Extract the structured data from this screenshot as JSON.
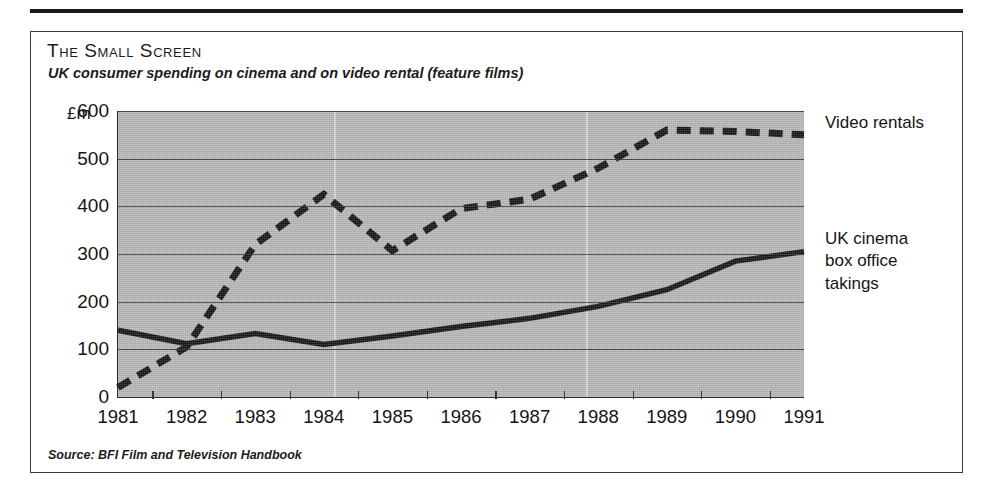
{
  "figure": {
    "title": "The Small Screen",
    "subtitle": "UK consumer spending on cinema and on video rental (feature films)",
    "source": "Source: BFI Film and Television Handbook"
  },
  "legend": {
    "rentals_label": "Video rentals",
    "cinema_label": "UK cinema\nbox office\ntakings"
  },
  "axis": {
    "y_unit": "£m",
    "y_ticks": [
      "600",
      "500",
      "400",
      "300",
      "200",
      "100",
      "0"
    ],
    "x_ticks": [
      "1981",
      "1982",
      "1983",
      "1984",
      "1985",
      "1986",
      "1987",
      "1988",
      "1989",
      "1990",
      "1991"
    ]
  },
  "colors": {
    "plot_background": "#b8b8b8",
    "ink": "#1a1a1a",
    "gridline": "#2f2f2f",
    "page": "#ffffff"
  },
  "chart_data": {
    "type": "line",
    "title": "The Small Screen",
    "subtitle": "UK consumer spending on cinema and on video rental (feature films)",
    "xlabel": "",
    "ylabel": "£m",
    "ylim": [
      0,
      600
    ],
    "y_ticks": [
      0,
      100,
      200,
      300,
      400,
      500,
      600
    ],
    "grid": true,
    "legend_position": "right",
    "source": "Source: BFI Film and Television Handbook",
    "x": [
      1981,
      1982,
      1983,
      1984,
      1985,
      1986,
      1987,
      1988,
      1989,
      1990,
      1991
    ],
    "categories": [
      "1981",
      "1982",
      "1983",
      "1984",
      "1985",
      "1986",
      "1987",
      "1988",
      "1989",
      "1990",
      "1991"
    ],
    "series": [
      {
        "name": "Video rentals",
        "style": "dashed",
        "values": [
          20,
          105,
          320,
          425,
          307,
          395,
          415,
          480,
          560,
          557,
          550
        ]
      },
      {
        "name": "UK cinema box office takings",
        "style": "solid",
        "values": [
          140,
          112,
          133,
          110,
          128,
          148,
          165,
          190,
          225,
          285,
          305
        ]
      }
    ]
  }
}
